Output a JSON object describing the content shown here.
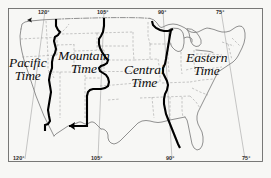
{
  "map": {
    "title": "United States Time Zones",
    "frame": {
      "stroke": "#6b6b6b"
    },
    "background_color": "#f7f7f5",
    "zone_boundary_color": "#000000",
    "state_border_color": "#8f8f8f",
    "coast_color": "#7d7d7d",
    "meridian_color": "#9a9a9a",
    "zones": [
      {
        "id": "pacific",
        "line1": "Pacific",
        "line2": "Time"
      },
      {
        "id": "mountain",
        "line1": "Mountain",
        "line2": "Time"
      },
      {
        "id": "central",
        "line1": "Central",
        "line2": "Time"
      },
      {
        "id": "eastern",
        "line1": "Eastern",
        "line2": "Time"
      }
    ],
    "meridians_top": [
      {
        "id": "top-120",
        "label": "120°"
      },
      {
        "id": "top-105",
        "label": "105°"
      },
      {
        "id": "top-90",
        "label": "90°"
      },
      {
        "id": "top-75",
        "label": "75°"
      }
    ],
    "meridians_bottom": [
      {
        "id": "bottom-120",
        "label": "120°"
      },
      {
        "id": "bottom-105",
        "label": "105°"
      },
      {
        "id": "bottom-90",
        "label": "90°"
      },
      {
        "id": "bottom-75",
        "label": "75°"
      }
    ]
  }
}
